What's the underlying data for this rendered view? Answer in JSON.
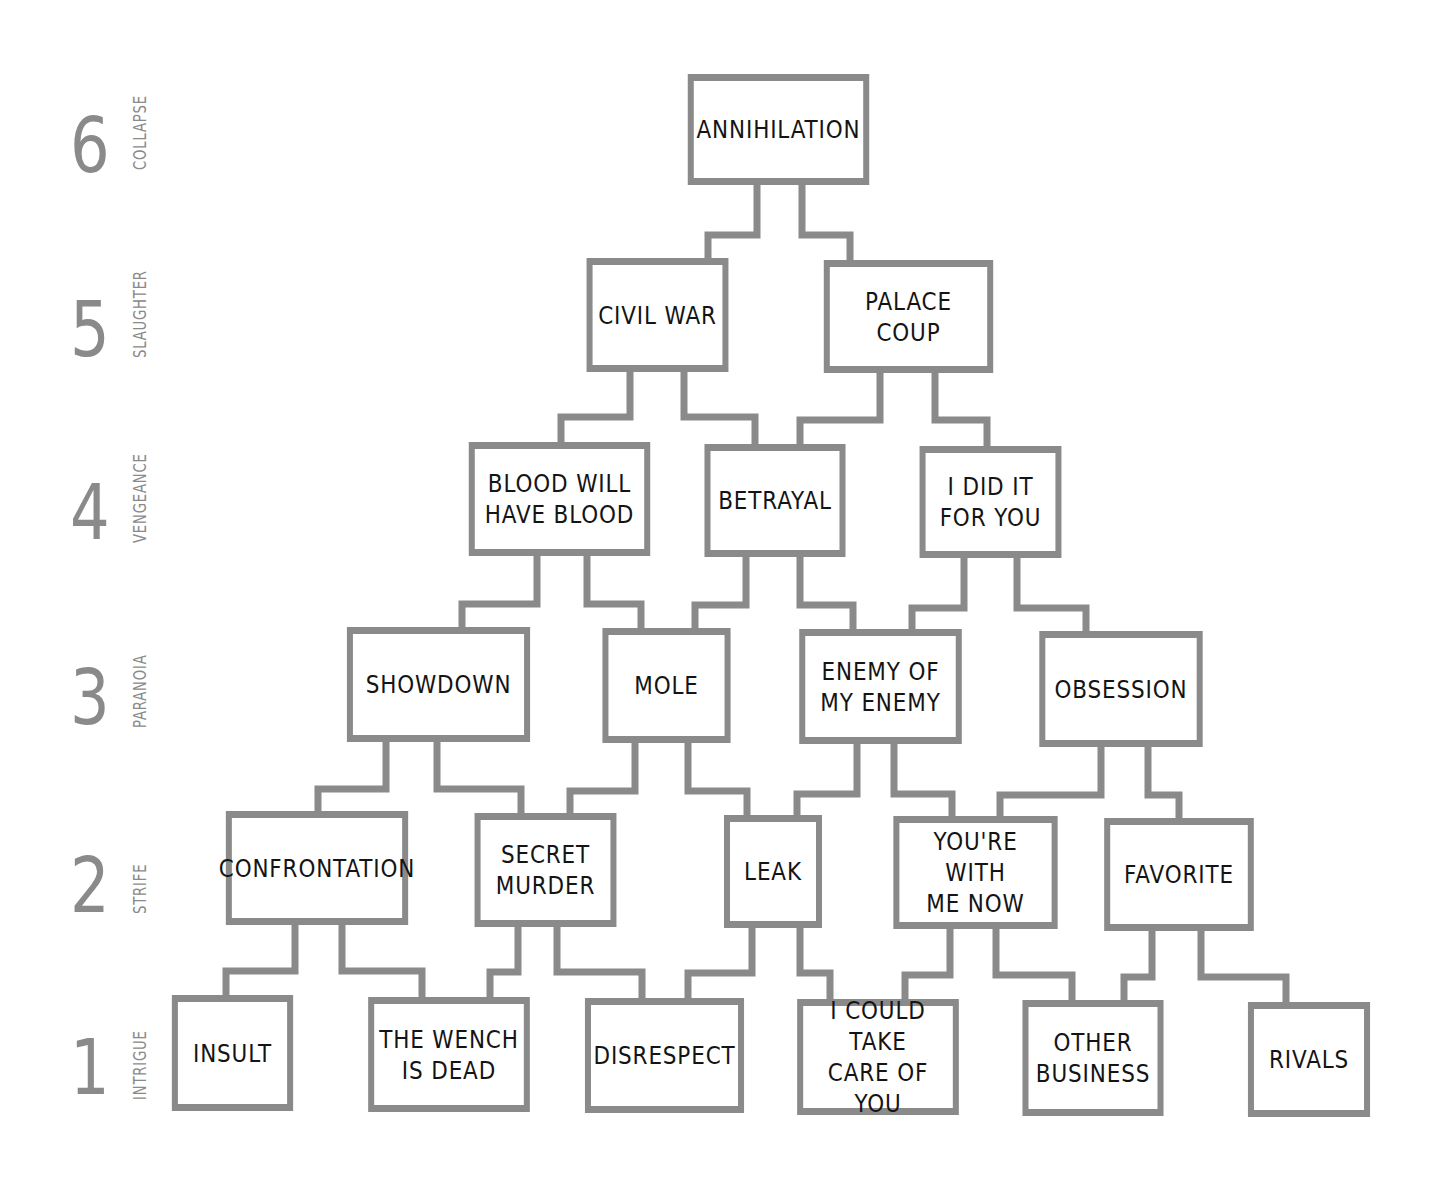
{
  "diagram": {
    "type": "hierarchy-pyramid",
    "line_color": "#8a8a8a",
    "text_color": "#141414",
    "levels": [
      {
        "number": "6",
        "name": "COLLAPSE"
      },
      {
        "number": "5",
        "name": "SLAUGHTER"
      },
      {
        "number": "4",
        "name": "VENGEANCE"
      },
      {
        "number": "3",
        "name": "PARANOIA"
      },
      {
        "number": "2",
        "name": "STRIFE"
      },
      {
        "number": "1",
        "name": "INTRIGUE"
      }
    ],
    "nodes": {
      "annihilation": "ANNIHILATION",
      "civil_war": "CIVIL WAR",
      "palace_coup": "PALACE COUP",
      "blood_will_have_blood": "BLOOD WILL\nHAVE BLOOD",
      "betrayal": "BETRAYAL",
      "i_did_it_for_you": "I DID IT\nFOR YOU",
      "showdown": "SHOWDOWN",
      "mole": "MOLE",
      "enemy_of_my_enemy": "ENEMY OF\nMY ENEMY",
      "obsession": "OBSESSION",
      "confrontation": "CONFRONTATION",
      "secret_murder": "SECRET\nMURDER",
      "leak": "LEAK",
      "youre_with_me_now": "YOU'RE WITH\nME NOW",
      "favorite": "FAVORITE",
      "insult": "INSULT",
      "the_wench_is_dead": "THE WENCH\nIS DEAD",
      "disrespect": "DISRESPECT",
      "i_could_take_care_of_you": "I COULD TAKE\nCARE OF YOU",
      "other_business": "OTHER\nBUSINESS",
      "rivals": "RIVALS"
    },
    "edges": [
      [
        "civil_war",
        "annihilation"
      ],
      [
        "palace_coup",
        "annihilation"
      ],
      [
        "blood_will_have_blood",
        "civil_war"
      ],
      [
        "betrayal",
        "civil_war"
      ],
      [
        "betrayal",
        "palace_coup"
      ],
      [
        "i_did_it_for_you",
        "palace_coup"
      ],
      [
        "showdown",
        "blood_will_have_blood"
      ],
      [
        "mole",
        "blood_will_have_blood"
      ],
      [
        "mole",
        "betrayal"
      ],
      [
        "enemy_of_my_enemy",
        "betrayal"
      ],
      [
        "enemy_of_my_enemy",
        "i_did_it_for_you"
      ],
      [
        "obsession",
        "i_did_it_for_you"
      ],
      [
        "confrontation",
        "showdown"
      ],
      [
        "secret_murder",
        "showdown"
      ],
      [
        "secret_murder",
        "mole"
      ],
      [
        "leak",
        "mole"
      ],
      [
        "leak",
        "enemy_of_my_enemy"
      ],
      [
        "youre_with_me_now",
        "enemy_of_my_enemy"
      ],
      [
        "youre_with_me_now",
        "obsession"
      ],
      [
        "favorite",
        "obsession"
      ],
      [
        "insult",
        "confrontation"
      ],
      [
        "the_wench_is_dead",
        "confrontation"
      ],
      [
        "the_wench_is_dead",
        "secret_murder"
      ],
      [
        "disrespect",
        "secret_murder"
      ],
      [
        "disrespect",
        "leak"
      ],
      [
        "i_could_take_care_of_you",
        "leak"
      ],
      [
        "i_could_take_care_of_you",
        "youre_with_me_now"
      ],
      [
        "other_business",
        "youre_with_me_now"
      ],
      [
        "other_business",
        "favorite"
      ],
      [
        "rivals",
        "favorite"
      ]
    ]
  }
}
